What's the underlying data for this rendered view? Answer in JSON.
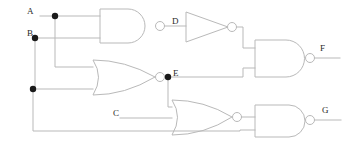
{
  "diagram": {
    "type": "logic-circuit-schematic",
    "width": 350,
    "height": 147,
    "colors": {
      "wire": "#b9b9b9",
      "gate_outline": "#b9b9b9",
      "junction_dot": "#1a1a1a",
      "label_text": "#2a2a2a",
      "background": "#ffffff"
    }
  },
  "labels": {
    "input_a": "A",
    "input_b": "B",
    "input_c": "C",
    "node_d": "D",
    "node_e": "E",
    "output_f": "F",
    "output_g": "G"
  },
  "inputs": [
    {
      "name": "A",
      "label": "A",
      "x": 27,
      "y": 8,
      "wire_y": 16
    },
    {
      "name": "B",
      "label": "B",
      "x": 27,
      "y": 30,
      "wire_y": 38
    },
    {
      "name": "C",
      "label": "C",
      "x": 113,
      "y": 110,
      "wire_y": 118
    }
  ],
  "nodes": [
    {
      "name": "D",
      "label": "D",
      "x": 172,
      "y": 18,
      "source_gate": "nand1"
    },
    {
      "name": "E",
      "label": "E",
      "x": 172,
      "y": 70,
      "source_gate": "nor1"
    }
  ],
  "outputs": [
    {
      "name": "F",
      "label": "F",
      "x": 320,
      "y": 45,
      "source_gate": "nand2"
    },
    {
      "name": "G",
      "label": "G",
      "x": 322,
      "y": 107,
      "source_gate": "nand3"
    }
  ],
  "gates": [
    {
      "id": "nand1",
      "type": "NAND",
      "inputs": [
        "A",
        "B"
      ],
      "output": "D",
      "x": 100,
      "y": 9,
      "w": 55,
      "h": 34
    },
    {
      "id": "not1",
      "type": "NOT",
      "inputs": [
        "D"
      ],
      "output": "nD",
      "x": 186,
      "y": 12,
      "w": 42,
      "h": 30
    },
    {
      "id": "nor1",
      "type": "NOR",
      "inputs": [
        "A",
        "B"
      ],
      "output": "E",
      "x": 93,
      "y": 60,
      "w": 62,
      "h": 35
    },
    {
      "id": "nand2",
      "type": "NAND",
      "inputs": [
        "nD",
        "E"
      ],
      "output": "F",
      "x": 255,
      "y": 40,
      "w": 50,
      "h": 37
    },
    {
      "id": "nor2",
      "type": "NOR",
      "inputs": [
        "E",
        "C"
      ],
      "output": "nEC",
      "x": 172,
      "y": 100,
      "w": 60,
      "h": 35
    },
    {
      "id": "nand3",
      "type": "NAND",
      "inputs": [
        "nEC",
        "B"
      ],
      "output": "G",
      "x": 255,
      "y": 105,
      "w": 50,
      "h": 32
    }
  ],
  "junctions": [
    {
      "name": "a-tap",
      "x": 55,
      "y": 16
    },
    {
      "name": "b-tap",
      "x": 35,
      "y": 38
    },
    {
      "name": "b-lower-tap",
      "x": 33,
      "y": 89
    },
    {
      "name": "e-tap",
      "x": 168,
      "y": 77
    }
  ]
}
